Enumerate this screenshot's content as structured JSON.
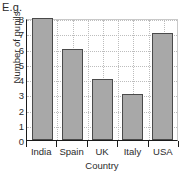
{
  "caption": "E.g.",
  "chart_data": {
    "type": "bar",
    "title": "",
    "xlabel": "Country",
    "ylabel": "Number of pupils",
    "categories": [
      "India",
      "Spain",
      "UK",
      "Italy",
      "USA"
    ],
    "values": [
      8,
      6,
      4,
      3,
      7
    ],
    "ylim": [
      0,
      8
    ],
    "yticks": [
      0,
      1,
      2,
      3,
      4,
      5,
      6,
      7,
      8
    ],
    "ytick_labels": [
      "0",
      "1",
      "2",
      "3",
      "4",
      "5",
      "6",
      "7",
      "8"
    ],
    "grid": true,
    "legend": false,
    "colors": {
      "bar_fill": "#a8a8a8",
      "bar_edge": "#4a4a4a",
      "grid": "#bdbdbd",
      "axis": "#1a1a1a",
      "text": "#2b2b2b",
      "background": "#ffffff"
    }
  }
}
